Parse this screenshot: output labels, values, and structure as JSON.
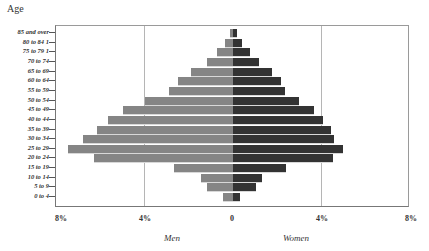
{
  "chart_data": {
    "type": "bar",
    "subtype": "population-pyramid",
    "title": "",
    "ylabel": "Age",
    "xlabel": "",
    "x_group_labels": {
      "left": "Men",
      "right": "Women"
    },
    "x_ticks": [
      "8%",
      "4%",
      "0",
      "4%",
      "8%"
    ],
    "xlim": [
      -8,
      8
    ],
    "grid": "vertical at 4%",
    "categories": [
      "85  and over",
      "80 to 84 1",
      "75 to 79 1",
      "70 to 74",
      "65 to 69",
      "60 to 64",
      "55 to 59",
      "50 to 54",
      "45 to 49",
      "40 to 44",
      "35 to 39",
      "30 to 34",
      "25 to 29",
      "20 to 24",
      "15 to 19",
      "10 to 14",
      "5 to 9",
      "0 to 4"
    ],
    "series": [
      {
        "name": "Men",
        "color": "#858585",
        "values": [
          0.15,
          0.35,
          0.75,
          1.2,
          1.9,
          2.5,
          2.9,
          4.0,
          5.0,
          5.7,
          6.2,
          6.8,
          7.5,
          6.3,
          2.7,
          1.45,
          1.2,
          0.45
        ]
      },
      {
        "name": "Women",
        "color": "#333333",
        "values": [
          0.2,
          0.4,
          0.75,
          1.2,
          1.75,
          2.2,
          2.35,
          3.0,
          3.7,
          4.1,
          4.45,
          4.6,
          5.0,
          4.55,
          2.4,
          1.3,
          1.05,
          0.3
        ]
      }
    ]
  }
}
